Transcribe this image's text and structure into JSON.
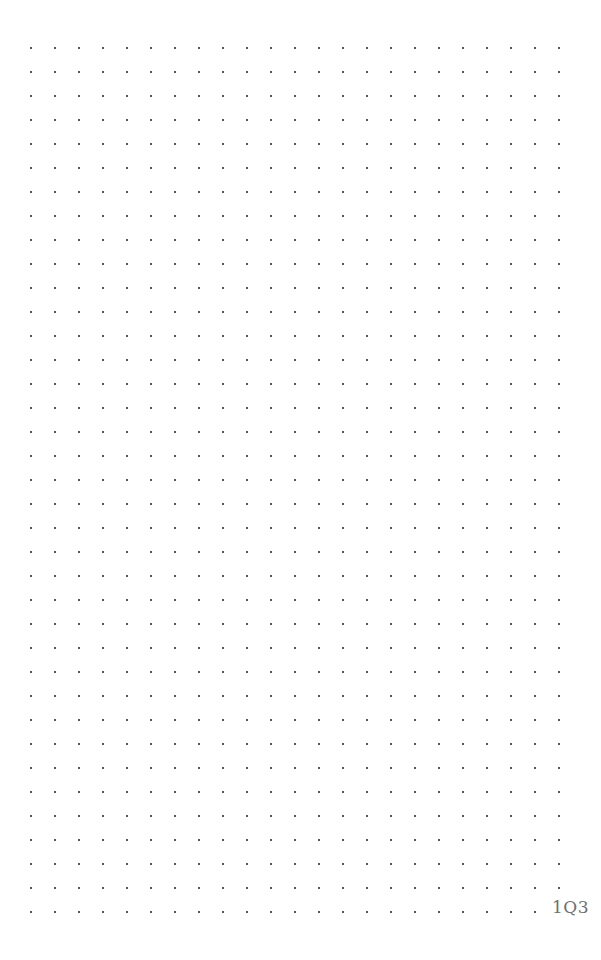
{
  "page": {
    "kind": "dot-grid-notebook-page",
    "width": 601,
    "height": 960,
    "background_color": "#ffffff"
  },
  "grid": {
    "dot_color": "#585858",
    "dot_size_px": 2,
    "spacing_px": 24,
    "origin_x": 30,
    "origin_y": 47,
    "columns": 23,
    "rows": 37,
    "last_column_x": 558,
    "last_row_y": 911,
    "omitted_cells": [
      {
        "row": 36,
        "col": 22
      }
    ]
  },
  "annotations": {
    "page_marker": {
      "text": "1Q3",
      "color": "#6e6e6e",
      "x": 552,
      "y": 899,
      "font_size_px": 17
    }
  }
}
